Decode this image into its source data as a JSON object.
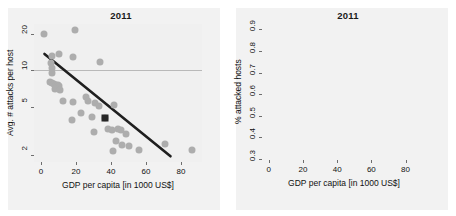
{
  "figure": {
    "background": "#ffffff",
    "point_color": "#adadad",
    "highlight_color": "#262626",
    "line_color": "#1f1f1f",
    "grid_color": "#b9b9b9",
    "panel_background": "#f0f0f0"
  },
  "chart_data": [
    {
      "type": "scatter",
      "panel": "left",
      "title": "2011",
      "xlabel": "GDP per capita [in 1000 US$]",
      "ylabel": "Avg. # attacks per host",
      "xlim": [
        -4,
        92
      ],
      "ylim": [
        1.75,
        24
      ],
      "yscale": "log",
      "xticks": [
        0,
        20,
        40,
        60,
        80
      ],
      "xticklabels": [
        "0",
        "20",
        "40",
        "60",
        "80"
      ],
      "yticks": [
        2,
        5,
        10,
        20
      ],
      "yticklabels": [
        "2",
        "5",
        "10",
        "20"
      ],
      "grid": "y-gridline at 10 only",
      "legend": "none",
      "points": [
        {
          "x": 1.5,
          "y": 19.8
        },
        {
          "x": 19.5,
          "y": 21.5
        },
        {
          "x": 6.0,
          "y": 13.2
        },
        {
          "x": 10.5,
          "y": 13.6
        },
        {
          "x": 18.5,
          "y": 12.8
        },
        {
          "x": 33.5,
          "y": 11.6
        },
        {
          "x": 5.5,
          "y": 11.5
        },
        {
          "x": 6.5,
          "y": 10.4
        },
        {
          "x": 6.0,
          "y": 9.5
        },
        {
          "x": 5.0,
          "y": 8.0
        },
        {
          "x": 6.5,
          "y": 7.9
        },
        {
          "x": 7.5,
          "y": 7.7
        },
        {
          "x": 8.5,
          "y": 7.6
        },
        {
          "x": 9.5,
          "y": 7.5
        },
        {
          "x": 10.5,
          "y": 7.4
        },
        {
          "x": 8.0,
          "y": 7.0
        },
        {
          "x": 11.0,
          "y": 6.8
        },
        {
          "x": 12.5,
          "y": 5.6
        },
        {
          "x": 18.5,
          "y": 5.5
        },
        {
          "x": 25.5,
          "y": 6.0
        },
        {
          "x": 27.0,
          "y": 5.6
        },
        {
          "x": 31.0,
          "y": 5.4
        },
        {
          "x": 33.0,
          "y": 5.1
        },
        {
          "x": 41.5,
          "y": 5.2
        },
        {
          "x": 17.5,
          "y": 3.9
        },
        {
          "x": 23.0,
          "y": 4.4
        },
        {
          "x": 29.0,
          "y": 4.1
        },
        {
          "x": 36.5,
          "y": 4.0
        },
        {
          "x": 30.0,
          "y": 3.1
        },
        {
          "x": 38.5,
          "y": 3.3
        },
        {
          "x": 40.5,
          "y": 3.2
        },
        {
          "x": 44.0,
          "y": 3.3
        },
        {
          "x": 45.5,
          "y": 3.2
        },
        {
          "x": 48.5,
          "y": 3.0
        },
        {
          "x": 43.0,
          "y": 2.6
        },
        {
          "x": 46.5,
          "y": 2.4
        },
        {
          "x": 50.5,
          "y": 2.35
        },
        {
          "x": 41.0,
          "y": 2.15
        },
        {
          "x": 56.0,
          "y": 2.2
        },
        {
          "x": 71.0,
          "y": 2.45
        },
        {
          "x": 86.0,
          "y": 2.2
        }
      ],
      "highlight_point": {
        "x": 36.5,
        "y": 4.05,
        "marker": "filled-square"
      },
      "fit": {
        "shape": "straight-line-on-log-y",
        "x_start": 2.0,
        "y_start": 13.6,
        "x_end": 74.0,
        "y_end": 1.95
      }
    },
    {
      "type": "scatter",
      "panel": "right",
      "title": "2011",
      "xlabel": "GDP per capita [in 1000 US$]",
      "ylabel": "% attacked hosts",
      "xlim": [
        -4,
        92
      ],
      "ylim": [
        0.295,
        0.925
      ],
      "yscale": "linear",
      "xticks": [
        0,
        20,
        40,
        60,
        80
      ],
      "xticklabels": [
        "0",
        "20",
        "40",
        "60",
        "80"
      ],
      "yticks": [
        0.3,
        0.4,
        0.5,
        0.6,
        0.7,
        0.8,
        0.9
      ],
      "yticklabels": [
        "0.3",
        "0.4",
        "0.5",
        "0.6",
        "0.7",
        "0.8",
        "0.9"
      ],
      "grid": "horizontal gridlines at every y tick",
      "legend": "none",
      "points": [
        {
          "x": 20.0,
          "y": 0.905
        },
        {
          "x": 1.0,
          "y": 0.795
        },
        {
          "x": 4.5,
          "y": 0.815
        },
        {
          "x": 5.5,
          "y": 0.805
        },
        {
          "x": 2.0,
          "y": 0.775
        },
        {
          "x": 10.0,
          "y": 0.785
        },
        {
          "x": 11.0,
          "y": 0.775
        },
        {
          "x": 11.5,
          "y": 0.755
        },
        {
          "x": 19.0,
          "y": 0.76
        },
        {
          "x": 4.0,
          "y": 0.735
        },
        {
          "x": 5.0,
          "y": 0.72
        },
        {
          "x": 6.0,
          "y": 0.705
        },
        {
          "x": 9.0,
          "y": 0.72
        },
        {
          "x": 10.5,
          "y": 0.705
        },
        {
          "x": 33.0,
          "y": 0.725
        },
        {
          "x": 18.0,
          "y": 0.69
        },
        {
          "x": 5.5,
          "y": 0.665
        },
        {
          "x": 6.5,
          "y": 0.65
        },
        {
          "x": 10.0,
          "y": 0.645
        },
        {
          "x": 11.0,
          "y": 0.625
        },
        {
          "x": 25.0,
          "y": 0.625
        },
        {
          "x": 27.5,
          "y": 0.61
        },
        {
          "x": 29.5,
          "y": 0.625
        },
        {
          "x": 31.0,
          "y": 0.61
        },
        {
          "x": 33.0,
          "y": 0.605
        },
        {
          "x": 8.5,
          "y": 0.595
        },
        {
          "x": 40.0,
          "y": 0.595
        },
        {
          "x": 25.5,
          "y": 0.555
        },
        {
          "x": 35.5,
          "y": 0.535
        },
        {
          "x": 18.5,
          "y": 0.515
        },
        {
          "x": 41.0,
          "y": 0.505
        },
        {
          "x": 43.5,
          "y": 0.49
        },
        {
          "x": 46.0,
          "y": 0.49
        },
        {
          "x": 48.0,
          "y": 0.49
        },
        {
          "x": 49.5,
          "y": 0.49
        },
        {
          "x": 30.0,
          "y": 0.445
        },
        {
          "x": 39.0,
          "y": 0.435
        },
        {
          "x": 44.0,
          "y": 0.38
        },
        {
          "x": 54.5,
          "y": 0.36
        },
        {
          "x": 43.5,
          "y": 0.325
        },
        {
          "x": 70.5,
          "y": 0.39
        },
        {
          "x": 86.0,
          "y": 0.37
        }
      ],
      "highlight_point": {
        "x": 36.5,
        "y": 0.5,
        "marker": "filled-square"
      },
      "fit": {
        "shape": "convex-decreasing-curve",
        "x_start": 0.5,
        "y_start": 0.8,
        "x_end": 88.0,
        "y_end": 0.305
      }
    }
  ]
}
